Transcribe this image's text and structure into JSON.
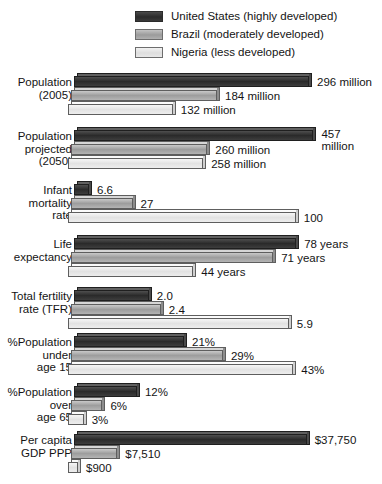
{
  "legend": {
    "items": [
      {
        "key": "us",
        "label": "United States (highly developed)",
        "color": "#2a2a2a"
      },
      {
        "key": "br",
        "label": "Brazil (moderately developed)",
        "color": "#9d9d9d"
      },
      {
        "key": "ng",
        "label": "Nigeria (less developed)",
        "color": "#e2e2e2"
      }
    ]
  },
  "chart_data": {
    "type": "bar",
    "orientation": "horizontal",
    "title": "",
    "xlabel": "",
    "ylabel": "",
    "grid": false,
    "legend_position": "top",
    "note": "Each indicator group is scaled independently to the width of the panel",
    "series": [
      {
        "name": "United States (highly developed)",
        "key": "us",
        "values": [
          296,
          457,
          6.6,
          78,
          2.0,
          21,
          12,
          37750
        ]
      },
      {
        "name": "Brazil (moderately developed)",
        "key": "br",
        "values": [
          184,
          260,
          27,
          71,
          2.4,
          29,
          6,
          7510
        ]
      },
      {
        "name": "Nigeria (less developed)",
        "key": "ng",
        "values": [
          132,
          258,
          100,
          44,
          5.9,
          43,
          3,
          900
        ]
      }
    ],
    "categories": [
      "Population (2005)",
      "Population projected (2050)",
      "Infant mortality rate",
      "Life expectancy",
      "Total fertility rate (TFR)",
      "%Population under age 15",
      "%Population over age 65",
      "Per capita GDP PPP"
    ],
    "groups": [
      {
        "id": "population-2005",
        "label_lines": [
          "Population",
          "(2005)"
        ],
        "top": 76,
        "axis_max": 330,
        "bars": [
          {
            "key": "us",
            "value": 296,
            "value_label": "296 million"
          },
          {
            "key": "br",
            "value": 184,
            "value_label": "184 million"
          },
          {
            "key": "ng",
            "value": 132,
            "value_label": "132 million"
          }
        ]
      },
      {
        "id": "population-projected-2050",
        "label_lines": [
          "Population",
          "projected",
          "(2050)"
        ],
        "top": 130,
        "axis_max": 500,
        "bars": [
          {
            "key": "us",
            "value": 457,
            "value_label": "457 million",
            "value_lines": [
              "457",
              "million"
            ]
          },
          {
            "key": "br",
            "value": 260,
            "value_label": "260 million"
          },
          {
            "key": "ng",
            "value": 258,
            "value_label": "258 million"
          }
        ]
      },
      {
        "id": "infant-mortality-rate",
        "label_lines": [
          "Infant",
          "mortality",
          "rate"
        ],
        "top": 184,
        "axis_max": 115,
        "bars": [
          {
            "key": "us",
            "value": 6.6,
            "value_label": "6.6"
          },
          {
            "key": "br",
            "value": 27,
            "value_label": "27"
          },
          {
            "key": "ng",
            "value": 100,
            "value_label": "100"
          }
        ]
      },
      {
        "id": "life-expectancy",
        "label_lines": [
          "Life",
          "expectancy"
        ],
        "top": 238,
        "axis_max": 92,
        "bars": [
          {
            "key": "us",
            "value": 78,
            "value_label": "78 years"
          },
          {
            "key": "br",
            "value": 71,
            "value_label": "71 years"
          },
          {
            "key": "ng",
            "value": 44,
            "value_label": "44 years"
          }
        ]
      },
      {
        "id": "total-fertility-rate",
        "label_lines": [
          "Total fertility",
          "rate (TFR)"
        ],
        "top": 290,
        "axis_max": 7.0,
        "bars": [
          {
            "key": "us",
            "value": 2.0,
            "value_label": "2.0"
          },
          {
            "key": "br",
            "value": 2.4,
            "value_label": "2.4"
          },
          {
            "key": "ng",
            "value": 5.9,
            "value_label": "5.9"
          }
        ]
      },
      {
        "id": "pct-population-under-15",
        "label_lines": [
          "%Population",
          "under",
          "age 15"
        ],
        "top": 336,
        "axis_max": 50,
        "bars": [
          {
            "key": "us",
            "value": 21,
            "value_label": "21%"
          },
          {
            "key": "br",
            "value": 29,
            "value_label": "29%"
          },
          {
            "key": "ng",
            "value": 43,
            "value_label": "43%"
          }
        ]
      },
      {
        "id": "pct-population-over-65",
        "label_lines": [
          "%Population",
          "over",
          "age 65"
        ],
        "top": 386,
        "axis_max": 50,
        "bars": [
          {
            "key": "us",
            "value": 12,
            "value_label": "12%"
          },
          {
            "key": "br",
            "value": 6,
            "value_label": "6%"
          },
          {
            "key": "ng",
            "value": 3,
            "value_label": "3%"
          }
        ]
      },
      {
        "id": "per-capita-gdp-ppp",
        "label_lines": [
          "Per capita",
          "GDP PPP"
        ],
        "top": 434,
        "axis_max": 42500,
        "bars": [
          {
            "key": "us",
            "value": 37750,
            "value_label": "$37,750"
          },
          {
            "key": "br",
            "value": 7510,
            "value_label": "$7,510"
          },
          {
            "key": "ng",
            "value": 900,
            "value_label": "$900"
          }
        ]
      }
    ]
  }
}
